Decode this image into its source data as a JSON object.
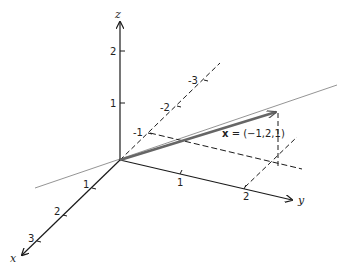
{
  "diagram": {
    "axes": {
      "x": {
        "label": "x",
        "ticks": [
          "1",
          "2",
          "3"
        ]
      },
      "y": {
        "label": "y",
        "ticks": [
          "1",
          "2"
        ]
      },
      "z": {
        "label": "z",
        "ticks": [
          "1",
          "2"
        ]
      },
      "negative_x": {
        "ticks": [
          "-1",
          "-2",
          "-3"
        ]
      }
    },
    "vector": {
      "label_bold": "x",
      "label_rest": " = (−1,2,1)",
      "components": [
        -1,
        2,
        1
      ]
    },
    "colors": {
      "axis": "#1a1a1a",
      "vector": "#666666",
      "line": "#888888"
    }
  }
}
